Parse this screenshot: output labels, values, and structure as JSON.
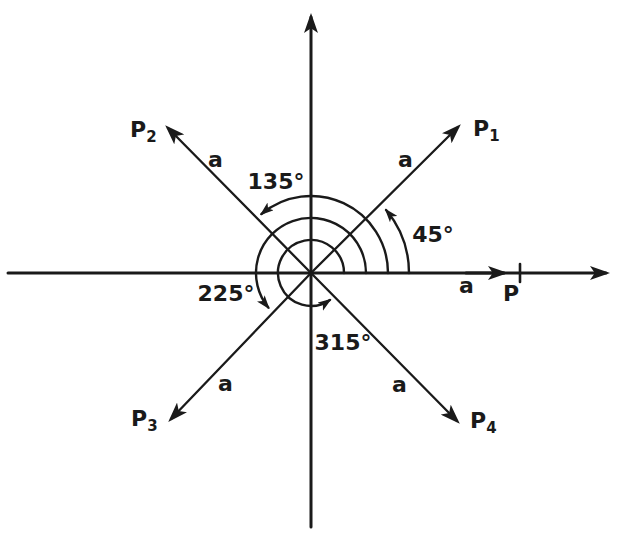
{
  "figure": {
    "background_color": "#ffffff",
    "ink_color": "#1a1a1a",
    "vectors": [
      {
        "id": "P1",
        "label_base": "P",
        "label_sub": "1",
        "angle_deg": 45,
        "magnitude_label": "a"
      },
      {
        "id": "P2",
        "label_base": "P",
        "label_sub": "2",
        "angle_deg": 135,
        "magnitude_label": "a"
      },
      {
        "id": "P3",
        "label_base": "P",
        "label_sub": "3",
        "angle_deg": 225,
        "magnitude_label": "a"
      },
      {
        "id": "P4",
        "label_base": "P",
        "label_sub": "4",
        "angle_deg": 315,
        "magnitude_label": "a"
      }
    ],
    "angle_arcs": [
      {
        "label": "45°",
        "from_deg": 0,
        "to_deg": 45
      },
      {
        "label": "135°",
        "from_deg": 0,
        "to_deg": 135
      },
      {
        "label": "225°",
        "from_deg": 0,
        "to_deg": 225
      },
      {
        "label": "315°",
        "from_deg": 0,
        "to_deg": 315
      }
    ],
    "pole": {
      "point_label": "P",
      "distance_label": "a"
    }
  }
}
